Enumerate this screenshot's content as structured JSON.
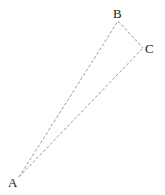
{
  "diagram": {
    "type": "triangle",
    "vertices": [
      {
        "id": "A",
        "label": "A"
      },
      {
        "id": "B",
        "label": "B"
      },
      {
        "id": "C",
        "label": "C"
      }
    ],
    "edges": [
      {
        "from": "A",
        "to": "B",
        "style": "dashed"
      },
      {
        "from": "B",
        "to": "C",
        "style": "dashed"
      },
      {
        "from": "A",
        "to": "C",
        "style": "dashed"
      }
    ],
    "colors": {
      "edge": "#9a9a9a",
      "label": "#222222"
    }
  }
}
